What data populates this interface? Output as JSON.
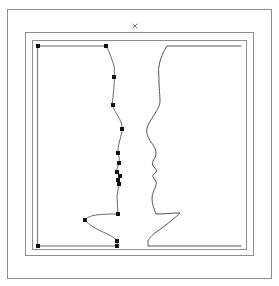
{
  "window": {
    "title": "Shape Editor",
    "background_color": "#ffffff",
    "width": 279,
    "height": 286
  },
  "frames": {
    "label": "Nested frame borders",
    "stroke_color": "#8d8d8d",
    "rects": [
      {
        "name": "outer-frame",
        "x": 7,
        "y": 9,
        "width": 265,
        "height": 270
      },
      {
        "name": "middle-frame",
        "x": 25,
        "y": 32,
        "width": 229,
        "height": 224
      },
      {
        "name": "inner-frame",
        "x": 32,
        "y": 40,
        "width": 215,
        "height": 210
      }
    ]
  },
  "marks": {
    "cross": {
      "name": "close-x-mark",
      "glyph": "x",
      "x": 135,
      "y": 26,
      "size": 5,
      "color": "#7a7a7a"
    }
  },
  "shapes": {
    "left_profile": {
      "name": "left-face-profile",
      "label": "Left silhouette profile with editable control points",
      "stroke_color": "#6a6a6a",
      "path": "M 38,46 L 106,46 C 110,52 112,60 114,66 C 115,70 114,73 114,77 C 115,84 113,92 113,98 C 112,102 112,105 113,107 C 115,112 119,117 121,122 C 122,125 122,127 122,129 C 122,134 120,139 119,143 C 118,147 118,150 118,153 C 119,157 120,160 119,163 C 118,167 116,169 117,172 C 118,174 120,174 120,176 C 120,178 118,178 118,180 C 118,182 119,182 119,184 C 119,188 117,192 117,197 C 117,203 118,208 118,214 C 113,214 105,214 96,215 C 90,216 86,218 85,220 C 89,225 96,229 103,232 C 110,235 115,238 117,241 C 117,242 117,244 117,246 L 38,246 Z",
      "handles": [
        {
          "name": "handle-top-left-corner",
          "x": 38,
          "y": 46
        },
        {
          "name": "handle-forehead-top",
          "x": 106,
          "y": 46
        },
        {
          "name": "handle-forehead",
          "x": 114,
          "y": 77
        },
        {
          "name": "handle-brow",
          "x": 113,
          "y": 105
        },
        {
          "name": "handle-nose-bridge",
          "x": 122,
          "y": 129
        },
        {
          "name": "handle-nose-tip",
          "x": 118,
          "y": 153
        },
        {
          "name": "handle-upper-lip",
          "x": 119,
          "y": 163
        },
        {
          "name": "handle-lip-a",
          "x": 117,
          "y": 172
        },
        {
          "name": "handle-lip-b",
          "x": 120,
          "y": 176
        },
        {
          "name": "handle-lip-c",
          "x": 118,
          "y": 180
        },
        {
          "name": "handle-chin-upper",
          "x": 119,
          "y": 184
        },
        {
          "name": "handle-chin",
          "x": 118,
          "y": 214
        },
        {
          "name": "handle-jaw-left",
          "x": 85,
          "y": 220
        },
        {
          "name": "handle-neck",
          "x": 117,
          "y": 241
        },
        {
          "name": "handle-bottom-right",
          "x": 117,
          "y": 246
        },
        {
          "name": "handle-bottom-left-corner",
          "x": 38,
          "y": 246
        }
      ],
      "handle_color": "#111111",
      "handle_size": 4
    },
    "right_profile": {
      "name": "right-face-profile",
      "label": "Right silhouette profile (mirrored)",
      "stroke_color": "#555555",
      "path": "M 241,46 L 167,46 C 163,52 160,59 159,66 C 158,71 159,75 159,80 C 159,88 160,96 160,101 C 160,106 157,110 154,115 C 151,120 148,124 147,128 C 146,133 148,138 151,142 C 154,146 156,149 156,153 C 156,157 154,159 153,161 C 152,163 152,165 154,167 C 156,169 157,170 156,172 C 154,174 152,175 153,177 C 155,180 157,182 156,185 C 155,189 152,193 152,198 C 152,204 154,209 156,214 C 163,214 172,213 180,213 C 174,219 166,225 159,230 C 153,234 149,238 148,241 C 148,243 148,245 148,246 L 241,246"
    }
  },
  "colors": {
    "frame_stroke": "#8d8d8d",
    "profile_stroke_left": "#6a6a6a",
    "profile_stroke_right": "#555555",
    "handle_fill": "#111111",
    "cross_stroke": "#7a7a7a",
    "canvas_background": "#ffffff"
  }
}
